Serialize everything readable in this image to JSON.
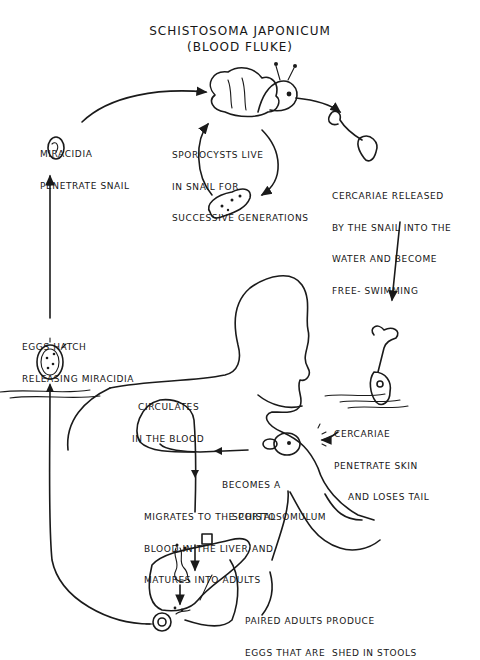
{
  "diagram": {
    "title": "SCHISTOSOMA JAPONICUM",
    "subtitle": "(BLOOD FLUKE)",
    "stages": [
      {
        "id": "miracidia",
        "lines": [
          "MIRACIDIA",
          "PENETRATE SNAIL"
        ]
      },
      {
        "id": "sporocysts",
        "lines": [
          "SPOROCYSTS LIVE",
          "IN SNAIL FOR",
          "SUCCESSIVE GENERATIONS"
        ]
      },
      {
        "id": "cercariae-released",
        "lines": [
          "CERCARIAE RELEASED",
          "BY THE SNAIL INTO THE",
          "WATER AND BECOME",
          "FREE- SWIMMING"
        ]
      },
      {
        "id": "eggs-hatch",
        "lines": [
          "EGGS HATCH",
          "RELEASING MIRACIDIA"
        ]
      },
      {
        "id": "circulates",
        "lines": [
          "CIRCULATES",
          "IN THE BLOOD"
        ]
      },
      {
        "id": "cercariae-penetrate",
        "lines": [
          "CERCARIAE",
          "PENETRATE SKIN",
          "AND LOSES TAIL"
        ]
      },
      {
        "id": "schistosomulum",
        "lines": [
          "BECOMES A",
          "SCHISTOSOMULUM"
        ]
      },
      {
        "id": "migrates",
        "lines": [
          "MIGRATES TO THE PORTAL",
          "BLOOD IN THE LIVER AND",
          "MATURES INTO ADULTS"
        ]
      },
      {
        "id": "paired-adults",
        "lines": [
          "PAIRED ADULTS PRODUCE",
          "EGGS THAT ARE  SHED IN STOOLS"
        ]
      }
    ],
    "illustrations": [
      "snail",
      "sporocyst",
      "cercaria-free",
      "cercaria-penetrating",
      "miracidium",
      "egg",
      "schistosomulum",
      "human-torso",
      "liver-and-intestine",
      "adult-worm-pair",
      "water-surface"
    ],
    "colors": {
      "ink": "#1a1a1a",
      "background": "#ffffff"
    }
  }
}
